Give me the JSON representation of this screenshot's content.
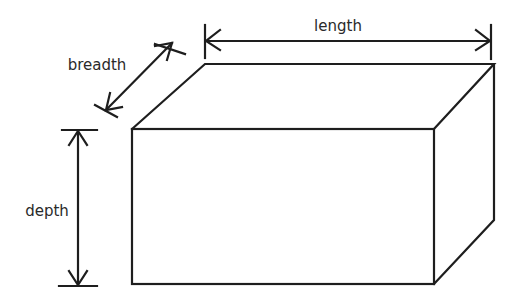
{
  "diagram": {
    "type": "cuboid-dimensions",
    "stroke_color": "#1e1e1e",
    "background": "#ffffff",
    "labels": {
      "length": "length",
      "breadth": "breadth",
      "depth": "depth"
    },
    "shape": {
      "front_face": {
        "x1": 132,
        "y1": 129,
        "x2": 434,
        "y2": 284
      },
      "back_top_left": [
        205,
        64
      ],
      "back_top_right": [
        494,
        64
      ],
      "back_bottom_right": [
        494,
        220
      ]
    }
  }
}
